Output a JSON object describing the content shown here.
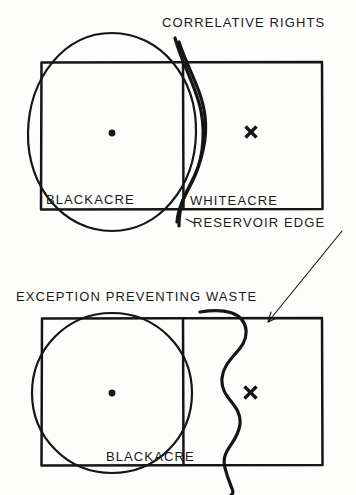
{
  "figure": {
    "background_color": "#fdfdfc",
    "ink_color": "#151515",
    "panels": [
      {
        "id": "panel-correlative-rights",
        "heading": "CORRELATIVE  RIGHTS",
        "labels": {
          "left_parcel": "BLACKACRE",
          "right_parcel": "WHITEACRE",
          "reservoir": "RESERVOIR EDGE"
        },
        "markers": {
          "well_dot": "dot-marker",
          "well_cross": "x-marker"
        }
      },
      {
        "id": "panel-exception-preventing-waste",
        "heading": "EXCEPTION PREVENTING  WASTE",
        "labels": {
          "left_parcel": "BLACKACRE"
        },
        "markers": {
          "well_dot": "dot-marker",
          "well_cross": "x-marker"
        }
      }
    ],
    "leader_line": {
      "name": "leader-arrow",
      "from": "RESERVOIR EDGE",
      "to": "wavy reservoir boundary in lower panel"
    }
  }
}
